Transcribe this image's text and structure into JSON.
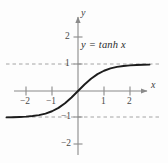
{
  "figure": {
    "background_color": "#fdfdfd",
    "axis_color": "#8a8a8a",
    "curve_color": "#1c1c1c",
    "asymptote_color": "#9a9a9a",
    "label_color": "#2b2b2b"
  },
  "axes": {
    "x_axis_name": "x",
    "y_axis_name": "y"
  },
  "chart_data": {
    "type": "line",
    "title": "",
    "subtitle": "",
    "xlabel": "x",
    "ylabel": "y",
    "annotation": "y = tanh x",
    "function": "y = tanh x",
    "xlim": [
      -2.9,
      2.75
    ],
    "ylim": [
      -2.45,
      2.3
    ],
    "xticks": [
      -2,
      -1,
      1,
      2
    ],
    "xtick_labels": [
      "−2",
      "−1",
      "1",
      "2"
    ],
    "yticks": [
      2,
      1,
      -1,
      -2
    ],
    "ytick_labels": [
      "2",
      "1",
      "−1",
      "−2"
    ],
    "grid": false,
    "legend": "none",
    "asymptotes": [
      {
        "type": "horizontal",
        "value": 1,
        "style": "dashed"
      },
      {
        "type": "horizontal",
        "value": -1,
        "style": "dashed"
      }
    ],
    "series": [
      {
        "name": "y = tanh x",
        "x": [
          -2.75,
          -2.5,
          -2.25,
          -2.0,
          -1.75,
          -1.5,
          -1.25,
          -1.0,
          -0.75,
          -0.5,
          -0.25,
          0.0,
          0.25,
          0.5,
          0.75,
          1.0,
          1.25,
          1.5,
          1.75,
          2.0,
          2.25,
          2.5,
          2.75
        ],
        "y": [
          -0.992,
          -0.987,
          -0.978,
          -0.964,
          -0.941,
          -0.905,
          -0.848,
          -0.762,
          -0.635,
          -0.462,
          -0.245,
          0.0,
          0.245,
          0.462,
          0.635,
          0.762,
          0.848,
          0.905,
          0.941,
          0.964,
          0.978,
          0.987,
          0.992
        ]
      }
    ]
  }
}
